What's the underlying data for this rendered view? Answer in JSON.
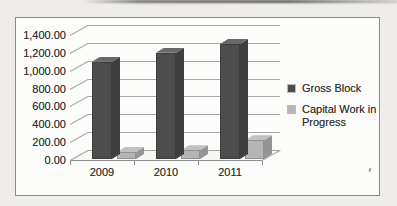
{
  "chart_data": {
    "type": "bar",
    "variant": "3d-clustered-column",
    "title": "",
    "xlabel": "",
    "ylabel": "",
    "categories": [
      "2009",
      "2010",
      "2011"
    ],
    "series": [
      {
        "name": "Gross Block",
        "values": [
          1100,
          1200,
          1300
        ],
        "color": "#4d4d4d"
      },
      {
        "name": "Capital Work in Progress",
        "values": [
          90,
          110,
          220
        ],
        "color": "#b5b5b5"
      }
    ],
    "ylim": [
      0,
      1400
    ],
    "ytick_interval": 200,
    "yticks": [
      "1,400.00",
      "1,200.00",
      "1,000.00",
      "800.00",
      "600.00",
      "400.00",
      "200.00",
      "0.00"
    ],
    "grid": true,
    "legend_position": "right"
  }
}
